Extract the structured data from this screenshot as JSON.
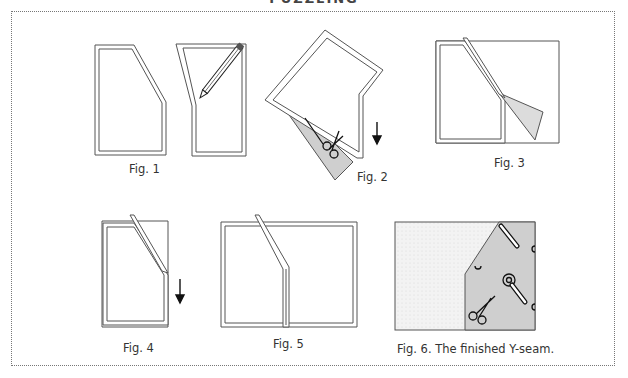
{
  "page": {
    "heading": "PUZZLING"
  },
  "figures": [
    {
      "id": "fig1",
      "caption": "Fig. 1",
      "depicts": "Two fabric pieces with angled Y-seam edges marked with a pencil"
    },
    {
      "id": "fig2",
      "caption": "Fig. 2",
      "depicts": "Pieces folded right sides together, trimmed with scissors, arrow pointing down"
    },
    {
      "id": "fig3",
      "caption": "Fig. 3",
      "depicts": "First diagonal seam sewn, corner flap folded back"
    },
    {
      "id": "fig4",
      "caption": "Fig. 4",
      "depicts": "Stack pivoted at the Y point, arrow pointing down to sew straight edge"
    },
    {
      "id": "fig5",
      "caption": "Fig. 5",
      "depicts": "Second straight seam sewn, pieces opened"
    },
    {
      "id": "fig6",
      "caption": "Fig. 6. The finished Y-seam.",
      "depicts": "Finished Y-seam with dotted white fabric and grey printed fabric"
    }
  ],
  "colors": {
    "line": "#555555",
    "fabric_grey": "#cfcfcf",
    "fabric_light": "#f1f1f1",
    "frame_border": "#777777"
  },
  "icons": [
    "pencil-icon",
    "scissors-icon",
    "arrow-down-icon",
    "rotary-cutter-icon"
  ]
}
